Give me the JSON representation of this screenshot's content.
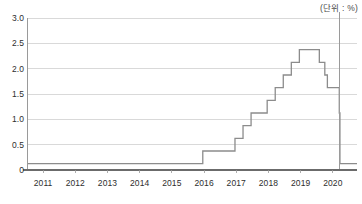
{
  "unit_note": "(단위 : %)",
  "chart_data": {
    "type": "line",
    "title": "",
    "subtitle": "",
    "xlabel": "",
    "ylabel": "",
    "unit": "%",
    "grid": true,
    "legend": false,
    "step": "post",
    "xlim": [
      2010.5,
      2020.75
    ],
    "ylim": [
      0,
      3.0
    ],
    "ytick_labels": [
      "3.0",
      "2.5",
      "2.0",
      "1.5",
      "1.0",
      "0.5",
      "0"
    ],
    "ytick_values": [
      3.0,
      2.5,
      2.0,
      1.5,
      1.0,
      0.5,
      0
    ],
    "xtick_labels": [
      "2011",
      "2012",
      "2013",
      "2014",
      "2015",
      "2016",
      "2017",
      "2018",
      "2019",
      "2020"
    ],
    "xtick_values": [
      2011,
      2012,
      2013,
      2014,
      2015,
      2016,
      2017,
      2018,
      2019,
      2020
    ],
    "series": [
      {
        "name": "policy-rate",
        "color": "#8c8c8c",
        "x": [
          2010.5,
          2015.96,
          2016.96,
          2017.21,
          2017.46,
          2017.96,
          2018.21,
          2018.46,
          2018.71,
          2018.96,
          2019.58,
          2019.75,
          2019.83,
          2020.2,
          2020.22,
          2020.75
        ],
        "values": [
          0.125,
          0.375,
          0.625,
          0.875,
          1.125,
          1.375,
          1.625,
          1.875,
          2.125,
          2.375,
          2.125,
          1.875,
          1.625,
          1.125,
          0.125,
          0.125
        ]
      }
    ],
    "annotations": [
      {
        "name": "event-marker-line",
        "type": "vline",
        "x": 2020.2,
        "color": "#9a9a9a"
      }
    ]
  }
}
